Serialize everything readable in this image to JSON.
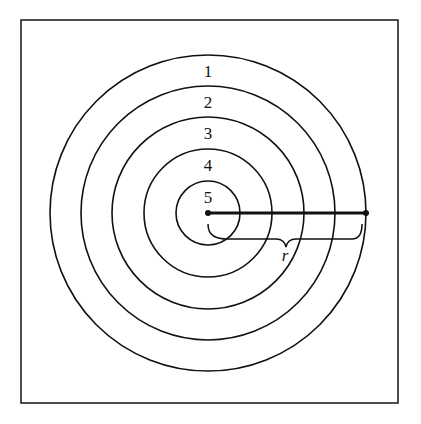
{
  "diagram": {
    "title": "",
    "rings": [
      {
        "label": "1",
        "radius": 158
      },
      {
        "label": "2",
        "radius": 127
      },
      {
        "label": "3",
        "radius": 96
      },
      {
        "label": "4",
        "radius": 64
      },
      {
        "label": "5",
        "radius": 32
      }
    ],
    "radius_label": "r",
    "colors": {
      "stroke": "#111111",
      "background": "#ffffff"
    }
  }
}
